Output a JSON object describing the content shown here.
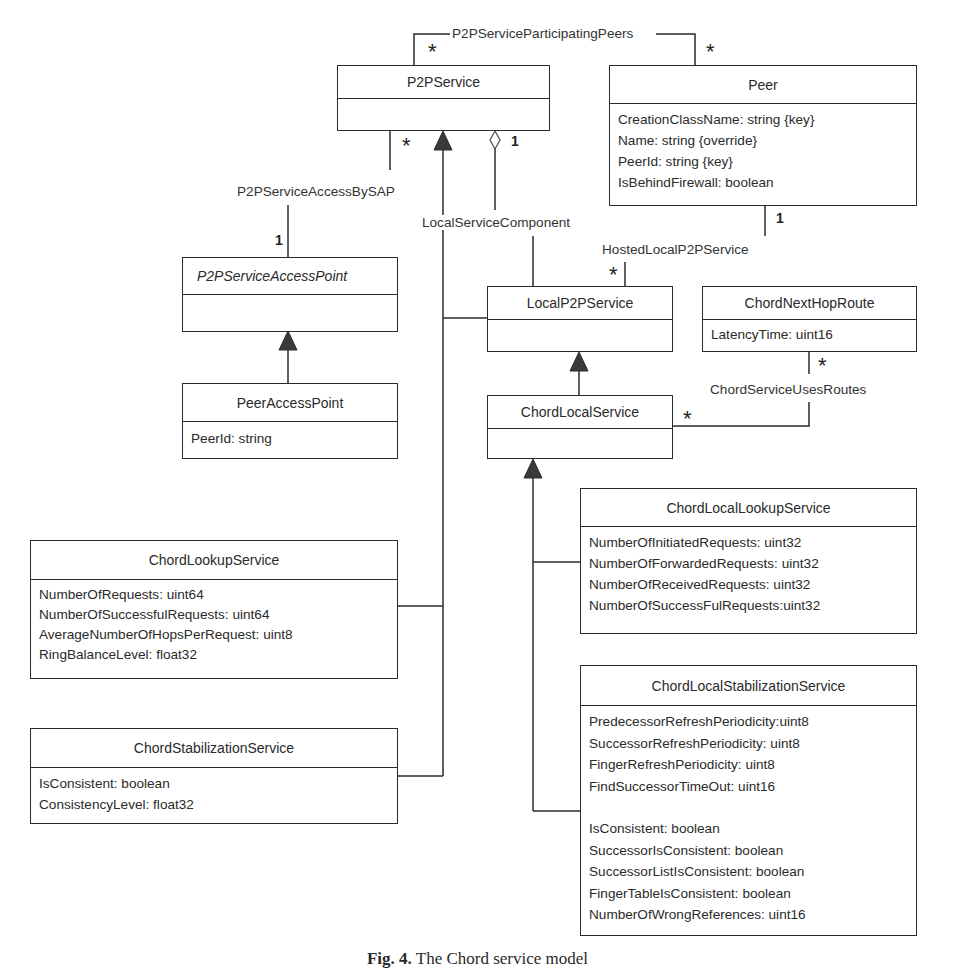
{
  "diagram": {
    "type": "UML class diagram",
    "classes": {
      "p2pservice": {
        "name": "P2PService",
        "attributes": []
      },
      "peer": {
        "name": "Peer",
        "attributes": [
          "CreationClassName: string {key}",
          "Name: string {override}",
          "PeerId: string {key}",
          "IsBehindFirewall: boolean"
        ]
      },
      "p2pserviceaccesspoint": {
        "name": "P2PServiceAccessPoint",
        "abstract": true,
        "attributes": []
      },
      "peeraccesspoint": {
        "name": "PeerAccessPoint",
        "attributes": [
          "PeerId: string"
        ]
      },
      "localp2pservice": {
        "name": "LocalP2PService",
        "attributes": []
      },
      "chordnexthoproute": {
        "name": "ChordNextHopRoute",
        "attributes": [
          "LatencyTime: uint16"
        ]
      },
      "chordlocalservice": {
        "name": "ChordLocalService",
        "attributes": []
      },
      "chordlookupservice": {
        "name": "ChordLookupService",
        "attributes": [
          "NumberOfRequests: uint64",
          "NumberOfSuccessfulRequests: uint64",
          "AverageNumberOfHopsPerRequest: uint8",
          "RingBalanceLevel: float32"
        ]
      },
      "chordstabilizationservice": {
        "name": "ChordStabilizationService",
        "attributes": [
          "IsConsistent: boolean",
          "ConsistencyLevel: float32"
        ]
      },
      "chordlocallookupservice": {
        "name": "ChordLocalLookupService",
        "attributes": [
          "NumberOfInitiatedRequests: uint32",
          "NumberOfForwardedRequests: uint32",
          "NumberOfReceivedRequests: uint32",
          "NumberOfSuccessFulRequests:uint32"
        ]
      },
      "chordlocalstabilizationservice": {
        "name": "ChordLocalStabilizationService",
        "attributes": [
          "PredecessorRefreshPeriodicity:uint8",
          "SuccessorRefreshPeriodicity: uint8",
          "FingerRefreshPeriodicity: uint8",
          "FindSuccessorTimeOut: uint16",
          "",
          "IsConsistent: boolean",
          "SuccessorIsConsistent: boolean",
          "SuccessorListIsConsistent: boolean",
          "FingerTableIsConsistent: boolean",
          "NumberOfWrongReferences: uint16"
        ]
      }
    },
    "associations": {
      "participating_peers": {
        "label": "P2PServiceParticipatingPeers",
        "mult_a": "*",
        "mult_b": "*"
      },
      "access_by_sap": {
        "label": "P2PServiceAccessBySAP",
        "mult_a": "*",
        "mult_b": "1"
      },
      "local_service_component": {
        "label": "LocalServiceComponent",
        "mult_a": "1"
      },
      "hosted_local": {
        "label": "HostedLocalP2PService",
        "mult_a": "1",
        "mult_b": "*"
      },
      "uses_routes": {
        "label": "ChordServiceUsesRoutes",
        "mult_a": "*",
        "mult_b": "*"
      }
    },
    "caption": {
      "prefix": "Fig. 4.",
      "text": "The Chord service model"
    },
    "colors": {
      "line": "#2b2b2b",
      "background": "#ffffff"
    }
  }
}
